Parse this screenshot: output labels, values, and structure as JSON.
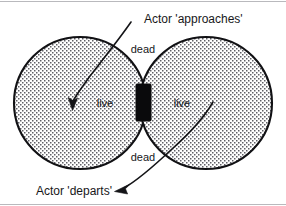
{
  "figure": {
    "type": "venn-two-circle-state-diagram",
    "background_color": "#ffffff",
    "ink_color": "#141417",
    "fill_pattern": "stipple-dots",
    "frame_rule_color": "#b9b9bd"
  },
  "regions": {
    "left_circle": {
      "name": "left-zone",
      "inner_label": "live",
      "center_x": 80,
      "center_y": 103,
      "radius": 66
    },
    "right_circle": {
      "name": "right-zone",
      "inner_label": "live",
      "center_x": 206,
      "center_y": 103,
      "radius": 66
    },
    "lens_top_label": "dead",
    "lens_bottom_label": "dead"
  },
  "gate": {
    "label": "",
    "color": "#0a0a0c",
    "x": 136,
    "y": 84,
    "width": 15,
    "height": 37
  },
  "annotations": [
    {
      "id": "approaches",
      "text": "Actor 'approaches'",
      "text_x": 144,
      "text_y": 19,
      "anchor": "start",
      "arrow_from_x": 130,
      "arrow_from_y": 22,
      "arrow_to_x": 72,
      "arrow_to_y": 108,
      "direction": "down-left"
    },
    {
      "id": "departs",
      "text": "Actor 'departs'",
      "text_x": 36,
      "text_y": 195,
      "anchor": "start",
      "arrow_from_x": 213,
      "arrow_from_y": 102,
      "arrow_to_x": 116,
      "arrow_to_y": 191,
      "direction": "down-left"
    }
  ],
  "icons": {
    "arrowhead": "arrowhead-icon",
    "stipple": "stipple-fill-icon"
  }
}
